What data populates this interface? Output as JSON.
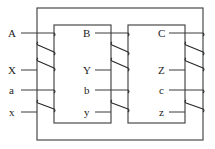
{
  "diagram": {
    "type": "three-phase transformer core with windings",
    "phases": [
      {
        "name": "phase-1",
        "hv_terminals": {
          "start": "A",
          "end": "X"
        },
        "lv_terminals": {
          "start": "a",
          "end": "x"
        }
      },
      {
        "name": "phase-2",
        "hv_terminals": {
          "start": "B",
          "end": "Y"
        },
        "lv_terminals": {
          "start": "b",
          "end": "y"
        }
      },
      {
        "name": "phase-3",
        "hv_terminals": {
          "start": "C",
          "end": "Z"
        },
        "lv_terminals": {
          "start": "c",
          "end": "z"
        }
      }
    ],
    "colors": {
      "line": "#3a3a3a",
      "background": "#ffffff"
    }
  }
}
